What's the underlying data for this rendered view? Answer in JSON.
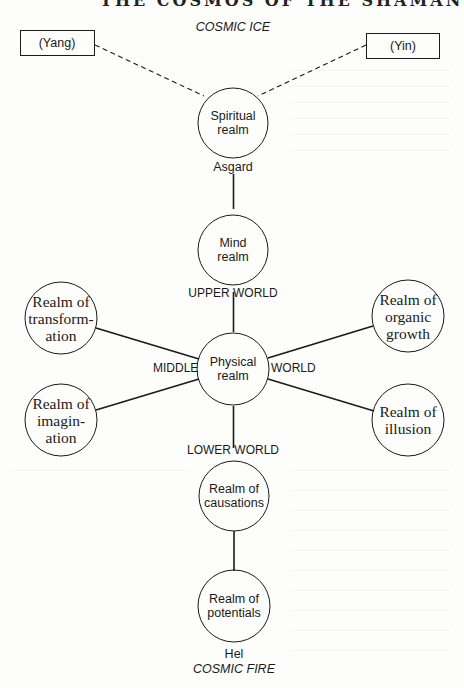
{
  "header_cutoff": "THE COSMOS OF THE SHAMAN",
  "top_label": "COSMIC ICE",
  "bottom_label": "COSMIC FIRE",
  "boxes": {
    "yang": "(Yang)",
    "yin": "(Yin)"
  },
  "nodes": {
    "spiritual": {
      "line1": "Spiritual",
      "line2": "realm",
      "line3": ""
    },
    "mind": {
      "line1": "Mind",
      "line2": "realm",
      "line3": ""
    },
    "physical": {
      "line1": "Physical",
      "line2": "realm",
      "line3": ""
    },
    "transformation": {
      "line1": "Realm of",
      "line2": "transform-",
      "line3": "ation"
    },
    "imagination": {
      "line1": "Realm of",
      "line2": "imagin-",
      "line3": "ation"
    },
    "organic_growth": {
      "line1": "Realm of",
      "line2": "organic",
      "line3": "growth"
    },
    "illusion": {
      "line1": "Realm of",
      "line2": "illusion",
      "line3": ""
    },
    "causations": {
      "line1": "Realm of",
      "line2": "causations",
      "line3": ""
    },
    "potentials": {
      "line1": "Realm of",
      "line2": "potentials",
      "line3": ""
    }
  },
  "world_labels": {
    "asgard": "Asgard",
    "upper_world": "UPPER WORLD",
    "middle": "MIDDLE",
    "world": "WORLD",
    "lower_world": "LOWER WORLD",
    "hel": "Hel"
  },
  "colors": {
    "ink": "#1a1a1a",
    "paper": "#fdfdfc"
  }
}
